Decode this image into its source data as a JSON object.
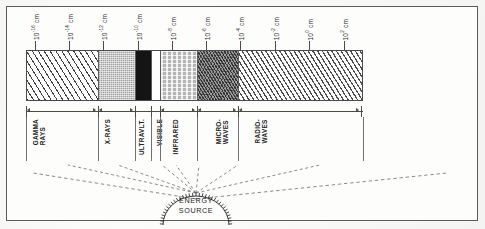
{
  "figure": {
    "scale_unit": "cm",
    "axis_caption": "wavelength"
  },
  "scale": {
    "ticks": [
      {
        "label_base": "10",
        "exponent": "-16",
        "unit": "cm",
        "x": 28
      },
      {
        "label_base": "10",
        "exponent": "-14",
        "unit": "cm",
        "x": 62
      },
      {
        "label_base": "10",
        "exponent": "-12",
        "unit": "cm",
        "x": 96
      },
      {
        "label_base": "10",
        "exponent": "-10",
        "unit": "cm",
        "x": 131
      },
      {
        "label_base": "10",
        "exponent": "-8",
        "unit": "cm",
        "x": 165
      },
      {
        "label_base": "10",
        "exponent": "-6",
        "unit": "cm",
        "x": 199
      },
      {
        "label_base": "10",
        "exponent": "-4",
        "unit": "cm",
        "x": 233
      },
      {
        "label_base": "10",
        "exponent": "-2",
        "unit": "cm",
        "x": 268
      },
      {
        "label_base": "10",
        "exponent": "0",
        "unit": "cm",
        "x": 302
      },
      {
        "label_base": "10",
        "exponent": "2",
        "unit": "cm",
        "x": 337
      }
    ]
  },
  "bands": [
    {
      "name": "GAMMA\nRAYS",
      "pattern": "diagonal-hatch-wide",
      "fill": "#ffffff",
      "width": 72,
      "label_x": 6,
      "ray_from": 42
    },
    {
      "name": "X-RAYS",
      "pattern": "fine-stipple",
      "fill": "#c9c9c9",
      "width": 37,
      "label_x": 78,
      "ray_from": 92
    },
    {
      "name": "ULTRAVLT.",
      "pattern": "solid-black",
      "fill": "#141414",
      "width": 16,
      "label_x": 112,
      "ray_from": 136
    },
    {
      "name": "VISIBLE",
      "pattern": "blank",
      "fill": "#fefefe",
      "width": 9,
      "label_x": 130,
      "ray_from": 150
    },
    {
      "name": "INFRARED",
      "pattern": "brick-stipple",
      "fill": "#b4b4b4",
      "width": 37,
      "label_x": 146,
      "ray_from": 173
    },
    {
      "name": "MICRO-\nWAVES",
      "pattern": "dense-cross-hatch",
      "fill": "#9e9e9e",
      "width": 41,
      "label_x": 189,
      "ray_from": 212
    },
    {
      "name": "RADIO-\nWAVES",
      "pattern": "diagonal-hatch",
      "fill": "#ffffff",
      "width": 123,
      "label_x": 228,
      "ray_from": 294
    }
  ],
  "band_dividers_x": [
    72,
    109,
    125,
    134,
    171,
    212
  ],
  "energy_source": {
    "line1": "ENERGY",
    "line2": "SOURCE"
  },
  "colors": {
    "ink": "#2b2b2b",
    "rule": "#4a4a4a",
    "paper": "#fdfdfc",
    "frame": "#5b5b5b",
    "ray": "#6d6d6d"
  }
}
